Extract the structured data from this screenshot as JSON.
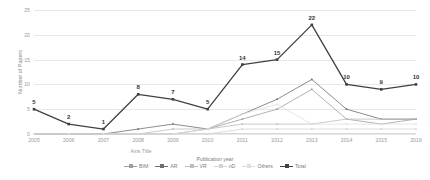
{
  "chart_data": {
    "type": "line",
    "title": "",
    "xlabel": "Axis Title",
    "ylabel": "Number of Papers",
    "legend_title": "Publication year",
    "legend_position": "bottom",
    "grid": true,
    "x": [
      2005,
      2006,
      2007,
      2008,
      2009,
      2010,
      2011,
      2012,
      2013,
      2014,
      2015,
      2016
    ],
    "xtick_labels": [
      "2005",
      "2006",
      "2007",
      "2008",
      "2009",
      "2010",
      "2011",
      "2012",
      "2013",
      "2014",
      "2015",
      "2016"
    ],
    "ylim": [
      0,
      25
    ],
    "ytick_labels": [
      "0",
      "5",
      "10",
      "15",
      "20",
      "25"
    ],
    "yticks": [
      0,
      5,
      10,
      15,
      20,
      25
    ],
    "series": [
      {
        "name": "BIM",
        "color": "#9e9e9e",
        "values": [
          0,
          0,
          0,
          0,
          0,
          1,
          3,
          5,
          9,
          3,
          2,
          3
        ],
        "show_labels": false
      },
      {
        "name": "AR",
        "color": "#6e6e6e",
        "values": [
          0,
          0,
          0,
          1,
          2,
          1,
          4,
          7,
          11,
          5,
          3,
          3
        ],
        "show_labels": false
      },
      {
        "name": "VR",
        "color": "#bdbdbd",
        "values": [
          0,
          0,
          0,
          0,
          1,
          1,
          2,
          2,
          2,
          3,
          3,
          3
        ],
        "show_labels": false
      },
      {
        "name": "nD",
        "color": "#d4d4d4",
        "values": [
          0,
          0,
          0,
          0,
          0,
          0,
          1,
          1,
          1,
          1,
          1,
          1
        ],
        "show_labels": false
      },
      {
        "name": "Others",
        "color": "#e0e0e0",
        "values": [
          0,
          0,
          0,
          0,
          0,
          1,
          4,
          6,
          2,
          2,
          2,
          2
        ],
        "show_labels": false
      },
      {
        "name": "Total",
        "color": "#404040",
        "values": [
          5,
          2,
          1,
          8,
          7,
          5,
          14,
          15,
          22,
          10,
          9,
          10
        ],
        "show_labels": true,
        "labels": [
          "5",
          "2",
          "1",
          "8",
          "7",
          "5",
          "14",
          "15",
          "22",
          "10",
          "9",
          "10"
        ]
      }
    ]
  }
}
